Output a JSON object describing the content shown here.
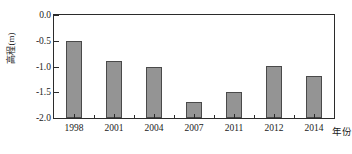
{
  "chart_data": {
    "type": "bar",
    "title": "",
    "subtitle": "",
    "xlabel": "年份",
    "ylabel": "高程(m)",
    "categories": [
      "1998",
      "2001",
      "2004",
      "2007",
      "2011",
      "2012",
      "2014"
    ],
    "values": [
      -0.5,
      -0.9,
      -1.0,
      -1.68,
      -1.5,
      -0.99,
      -1.18
    ],
    "series": [
      {
        "name": "高程",
        "values": [
          -0.5,
          -0.9,
          -1.0,
          -1.68,
          -1.5,
          -0.99,
          -1.18
        ]
      }
    ],
    "ylim": [
      -2.0,
      0.0
    ],
    "ytick_labels": [
      "0.0",
      "-0.5",
      "-1.0",
      "-1.5",
      "-2.0"
    ],
    "ytick_values": [
      0.0,
      -0.5,
      -1.0,
      -1.5,
      -2.0
    ],
    "xtick_labels": [
      "1998",
      "2001",
      "2004",
      "2007",
      "2011",
      "2012",
      "2014"
    ],
    "grid": false,
    "legend": "none",
    "baseline": 0.0,
    "bar_color": "#949494",
    "bar_edge_color": "#4a4a4a",
    "axis_color": "#2b2b2b",
    "background_color": "#ffffff"
  }
}
